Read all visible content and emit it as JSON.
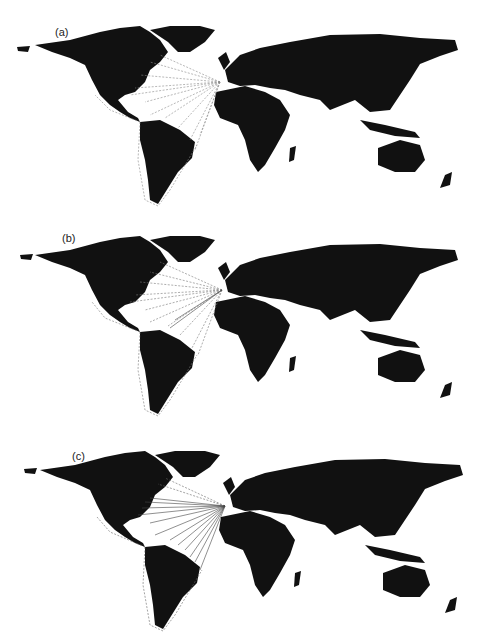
{
  "figure": {
    "panels": [
      {
        "label": "(a)",
        "route_style": "dashed",
        "route_color": "#888888"
      },
      {
        "label": "(b)",
        "route_style": "dashed",
        "route_color": "#777777"
      },
      {
        "label": "(c)",
        "route_style": "mixed-solid-dashed",
        "route_color": "#555555"
      }
    ],
    "land_color": "#111111",
    "background_color": "#ffffff",
    "route_origin": "Iberian Peninsula",
    "route_destinations": [
      "North America",
      "Caribbean",
      "South America",
      "Pacific coast of the Americas"
    ]
  }
}
